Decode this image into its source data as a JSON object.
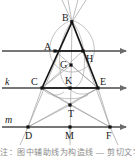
{
  "figure": {
    "type": "geometry-diagram",
    "background_color": "#ffffff",
    "stroke_color_main": "#1a1a1a",
    "stroke_color_construction": "#9a9a9a",
    "point_labels": {
      "B": "B",
      "A": "A",
      "H": "H",
      "G": "G",
      "C": "C",
      "K": "K",
      "E": "E",
      "T": "T",
      "D": "D",
      "M": "M",
      "F": "F"
    },
    "line_labels": {
      "k": "k",
      "m": "m"
    },
    "points": [
      {
        "name": "B",
        "x": 72,
        "y": 22,
        "label": "B",
        "label_dx": -10,
        "label_dy": -2
      },
      {
        "name": "A",
        "x": 55,
        "y": 51,
        "label": "A",
        "label_dx": -11,
        "label_dy": -2
      },
      {
        "name": "H",
        "x": 83,
        "y": 51,
        "label": "H",
        "label_dx": 3,
        "label_dy": 10
      },
      {
        "name": "G",
        "x": 71,
        "y": 65,
        "label": "G",
        "label_dx": -11,
        "label_dy": 2
      },
      {
        "name": "C",
        "x": 42,
        "y": 88,
        "label": "C",
        "label_dx": -11,
        "label_dy": -3
      },
      {
        "name": "K",
        "x": 70,
        "y": 88,
        "label": "K",
        "label_dx": -4,
        "label_dy": -4
      },
      {
        "name": "E",
        "x": 98,
        "y": 88,
        "label": "E",
        "label_dx": 3,
        "label_dy": -3
      },
      {
        "name": "T",
        "x": 70,
        "y": 105,
        "label": "T",
        "label_dx": -1,
        "label_dy": 11
      },
      {
        "name": "D",
        "x": 28,
        "y": 127,
        "label": "D",
        "label_dx": -3,
        "label_dy": 11
      },
      {
        "name": "M",
        "x": 70,
        "y": 127,
        "label": "M",
        "label_dx": -4,
        "label_dy": 11
      },
      {
        "name": "F",
        "x": 110,
        "y": 127,
        "label": "F",
        "label_dx": -4,
        "label_dy": 11
      }
    ],
    "horizontal_lines": [
      {
        "name": "line-AH",
        "y": 51,
        "x1": 2,
        "x2": 128,
        "label": "",
        "arrow": true
      },
      {
        "name": "line-k",
        "y": 88,
        "x1": 2,
        "x2": 128,
        "label": "k",
        "label_x": 6,
        "label_y": 85,
        "arrow": true
      },
      {
        "name": "line-m",
        "y": 127,
        "x1": 2,
        "x2": 128,
        "label": "m",
        "label_x": 6,
        "label_y": 123,
        "arrow": true
      }
    ],
    "caption_text": "注：图中辅助线为构造线 — 剪切文字"
  }
}
